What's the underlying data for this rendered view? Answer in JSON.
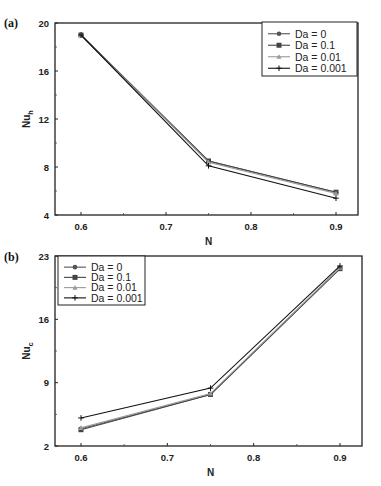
{
  "chart_data": [
    {
      "panel": "(a)",
      "type": "line",
      "title": "",
      "xlabel": "N",
      "ylabel": "Nu_h",
      "ylabel_main": "Nu",
      "ylabel_sub": "h",
      "x": [
        0.6,
        0.75,
        0.9
      ],
      "xlim": [
        0.57,
        0.93
      ],
      "ylim": [
        4,
        20
      ],
      "xticks": [
        "0.6",
        "0.7",
        "0.8",
        "0.9"
      ],
      "yticks": [
        "4",
        "8",
        "12",
        "16",
        "20"
      ],
      "grid": false,
      "legend_position": "upper right",
      "series": [
        {
          "name": "Da = 0",
          "values": [
            19.0,
            8.5,
            5.9
          ],
          "marker": "circle",
          "color": "#555555"
        },
        {
          "name": "Da = 0.1",
          "values": [
            19.0,
            8.5,
            5.9
          ],
          "marker": "square",
          "color": "#444444"
        },
        {
          "name": "Da = 0.01",
          "values": [
            19.0,
            8.4,
            5.8
          ],
          "marker": "triangle",
          "color": "#999999"
        },
        {
          "name": "Da = 0.001",
          "values": [
            19.0,
            8.1,
            5.4
          ],
          "marker": "plus",
          "color": "#111111"
        }
      ]
    },
    {
      "panel": "(b)",
      "type": "line",
      "title": "",
      "xlabel": "N",
      "ylabel": "Nu_c",
      "ylabel_main": "Nu",
      "ylabel_sub": "c",
      "x": [
        0.6,
        0.75,
        0.9
      ],
      "xlim": [
        0.57,
        0.93
      ],
      "ylim": [
        2,
        23
      ],
      "xticks": [
        "0.6",
        "0.7",
        "0.8",
        "0.9"
      ],
      "yticks": [
        "2",
        "9",
        "16",
        "23"
      ],
      "grid": false,
      "legend_position": "upper left",
      "series": [
        {
          "name": "Da = 0",
          "values": [
            3.9,
            7.7,
            21.6
          ],
          "marker": "circle",
          "color": "#555555"
        },
        {
          "name": "Da = 0.1",
          "values": [
            3.8,
            7.7,
            21.6
          ],
          "marker": "square",
          "color": "#444444"
        },
        {
          "name": "Da = 0.01",
          "values": [
            4.0,
            7.8,
            21.7
          ],
          "marker": "triangle",
          "color": "#999999"
        },
        {
          "name": "Da = 0.001",
          "values": [
            5.1,
            8.4,
            21.9
          ],
          "marker": "plus",
          "color": "#111111"
        }
      ]
    }
  ],
  "panels": {
    "a": {
      "label": "(a)"
    },
    "b": {
      "label": "(b)"
    }
  }
}
